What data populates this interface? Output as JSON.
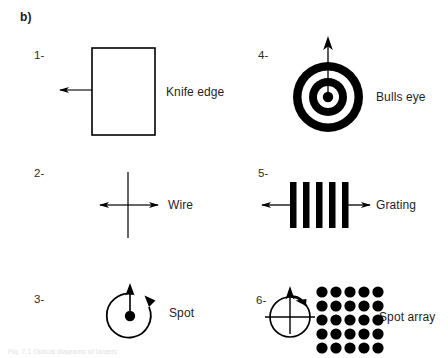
{
  "figure": {
    "panel_label": "b)",
    "background_color": "#ffffff",
    "ink_color": "#000000",
    "width": 448,
    "height": 358,
    "cut_off_caption": "Fig. 7.1 Optical diagrams of targets"
  },
  "items": [
    {
      "number": "1-",
      "caption": "Knife edge",
      "icon": "knife-edge-rectangle-with-left-arrow"
    },
    {
      "number": "2-",
      "caption": "Wire",
      "icon": "wire-vertical-line-with-double-arrow"
    },
    {
      "number": "3-",
      "caption": "Spot",
      "icon": "spot-dot-with-rotation-arrow"
    },
    {
      "number": "4-",
      "caption": "Bulls eye",
      "icon": "bulls-eye-concentric-rings-with-up-arrow"
    },
    {
      "number": "5-",
      "caption": "Grating",
      "icon": "grating-five-bars-with-double-arrow"
    },
    {
      "number": "6-",
      "caption": "Spot array",
      "icon": "spot-array-grid-with-rotation-arrow"
    }
  ],
  "geometry": {
    "grating_bar_count": 5,
    "spot_array_rows": 5,
    "spot_array_columns": 5,
    "bulls_eye_ring_count": 5
  }
}
